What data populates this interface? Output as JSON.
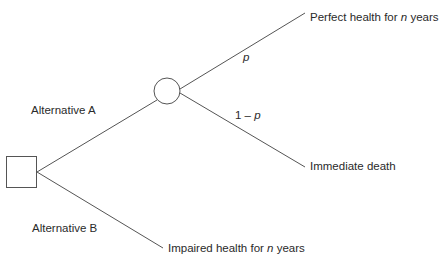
{
  "diagram": {
    "type": "decision-tree",
    "colors": {
      "line": "#555555",
      "text": "#2a2a2a",
      "background": "#ffffff"
    },
    "nodes": {
      "decision": {
        "shape": "square",
        "label": ""
      },
      "chance": {
        "shape": "circle",
        "label": ""
      }
    },
    "branches": {
      "alternative_a": {
        "label": "Alternative A"
      },
      "alternative_b": {
        "label": "Alternative B"
      },
      "prob_p": {
        "label_var": "p"
      },
      "prob_1_minus_p": {
        "label_prefix": "1 – ",
        "label_var": "p"
      }
    },
    "outcomes": {
      "perfect_health": {
        "prefix": "Perfect health for ",
        "var": "n",
        "suffix": " years"
      },
      "immediate_death": {
        "label": "Immediate death"
      },
      "impaired_health": {
        "prefix": "Impaired health for ",
        "var": "n",
        "suffix": " years"
      }
    }
  }
}
